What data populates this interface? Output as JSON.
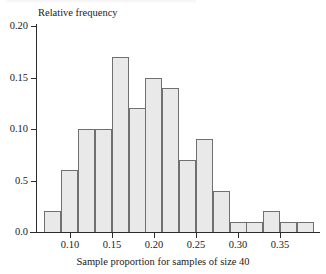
{
  "chart_data": {
    "type": "bar",
    "title": "",
    "subtitle": "",
    "xlabel": "Sample proportion for samples of size 40",
    "ylabel": "Relative frequency",
    "grid": false,
    "legend": false,
    "legend_position": "none",
    "bin_width": 0.02,
    "x_range": [
      0.07,
      0.39
    ],
    "xlim": [
      0.06,
      0.395
    ],
    "ylim": [
      0.0,
      0.2
    ],
    "xtick_labels": [
      "0.10",
      "0.15",
      "0.20",
      "0.25",
      "0.30",
      "0.35"
    ],
    "xtick_values": [
      0.1,
      0.15,
      0.2,
      0.25,
      0.3,
      0.35
    ],
    "ytick_labels": [
      "0.20",
      "0.15",
      "0.10",
      "0.5",
      "0.0"
    ],
    "ytick_values": [
      0.2,
      0.15,
      0.1,
      0.05,
      0.0
    ],
    "bin_edges": [
      0.07,
      0.09,
      0.11,
      0.13,
      0.15,
      0.17,
      0.19,
      0.21,
      0.23,
      0.25,
      0.27,
      0.29,
      0.31,
      0.33,
      0.35,
      0.37,
      0.39
    ],
    "categories": [
      "0.07-0.09",
      "0.09-0.11",
      "0.11-0.13",
      "0.13-0.15",
      "0.15-0.17",
      "0.17-0.19",
      "0.19-0.21",
      "0.21-0.23",
      "0.23-0.25",
      "0.25-0.27",
      "0.27-0.29",
      "0.29-0.31",
      "0.31-0.33",
      "0.33-0.35",
      "0.35-0.37",
      "0.37-0.39"
    ],
    "values": [
      0.02,
      0.06,
      0.1,
      0.1,
      0.17,
      0.12,
      0.15,
      0.14,
      0.07,
      0.09,
      0.04,
      0.01,
      0.01,
      0.02,
      0.01,
      0.01
    ],
    "bars": [
      {
        "label": "0.07-0.09",
        "x0": 0.07,
        "x1": 0.09,
        "value": 0.02
      },
      {
        "label": "0.09-0.11",
        "x0": 0.09,
        "x1": 0.11,
        "value": 0.06
      },
      {
        "label": "0.11-0.13",
        "x0": 0.11,
        "x1": 0.13,
        "value": 0.1
      },
      {
        "label": "0.13-0.15",
        "x0": 0.13,
        "x1": 0.15,
        "value": 0.1
      },
      {
        "label": "0.15-0.17",
        "x0": 0.15,
        "x1": 0.17,
        "value": 0.17
      },
      {
        "label": "0.17-0.19",
        "x0": 0.17,
        "x1": 0.19,
        "value": 0.12
      },
      {
        "label": "0.19-0.21",
        "x0": 0.19,
        "x1": 0.21,
        "value": 0.15
      },
      {
        "label": "0.21-0.23",
        "x0": 0.21,
        "x1": 0.23,
        "value": 0.14
      },
      {
        "label": "0.23-0.25",
        "x0": 0.23,
        "x1": 0.25,
        "value": 0.07
      },
      {
        "label": "0.25-0.27",
        "x0": 0.25,
        "x1": 0.27,
        "value": 0.09
      },
      {
        "label": "0.27-0.29",
        "x0": 0.27,
        "x1": 0.29,
        "value": 0.04
      },
      {
        "label": "0.29-0.31",
        "x0": 0.29,
        "x1": 0.31,
        "value": 0.01
      },
      {
        "label": "0.31-0.33",
        "x0": 0.31,
        "x1": 0.33,
        "value": 0.01
      },
      {
        "label": "0.33-0.35",
        "x0": 0.33,
        "x1": 0.35,
        "value": 0.02
      },
      {
        "label": "0.35-0.37",
        "x0": 0.35,
        "x1": 0.37,
        "value": 0.01
      },
      {
        "label": "0.37-0.39",
        "x0": 0.37,
        "x1": 0.39,
        "value": 0.01
      }
    ],
    "colors": {
      "bar_fill": "#e9e9e9",
      "bar_border": "#707070",
      "axis": "#2b2b2b",
      "text": "#1a1a1a",
      "background": "#ffffff"
    }
  }
}
